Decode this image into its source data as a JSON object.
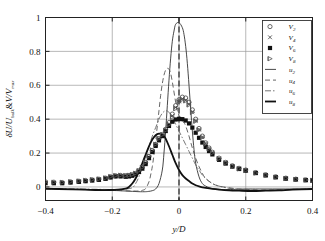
{
  "chart_data": {
    "type": "line",
    "title": "",
    "xlabel": "y/D",
    "ylabel": "δU/U_bulk & V/V_max",
    "ylabel_parts": {
      "delta": "δ",
      "U": "U",
      "bulk": "bulk",
      "amp": "&",
      "V": "V",
      "max": "max"
    },
    "xlim": [
      -0.4,
      0.4
    ],
    "ylim": [
      -0.08,
      1.0
    ],
    "xticks": [
      -0.4,
      -0.2,
      0,
      0.2,
      0.4
    ],
    "xticklabels": [
      "−0.4",
      "−0.2",
      "0",
      "0.2",
      "0.4"
    ],
    "yticks": [
      0,
      0.2,
      0.4,
      0.6,
      0.8,
      1
    ],
    "yticklabels": [
      "0",
      "0.2",
      "0.4",
      "0.6",
      "0.8",
      "1"
    ],
    "grid": "both",
    "vertical_marker_x": 0,
    "legend_position": "top-right",
    "legend": [
      {
        "name": "V2",
        "label": "V",
        "subscript": "2",
        "kind": "marker",
        "marker": "open-circle",
        "color": "#444444"
      },
      {
        "name": "V4",
        "label": "V",
        "subscript": "4",
        "kind": "marker",
        "marker": "cross",
        "color": "#444444"
      },
      {
        "name": "V6",
        "label": "V",
        "subscript": "6",
        "kind": "marker",
        "marker": "filled-square",
        "color": "#111111"
      },
      {
        "name": "V8",
        "label": "V",
        "subscript": "8",
        "kind": "marker",
        "marker": "right-triangle",
        "color": "#555555"
      },
      {
        "name": "u2",
        "label": "u",
        "subscript": "2",
        "kind": "line",
        "style": "solid-thin",
        "color": "#333333"
      },
      {
        "name": "u4",
        "label": "u",
        "subscript": "4",
        "kind": "line",
        "style": "dashed",
        "color": "#555555"
      },
      {
        "name": "u6",
        "label": "u",
        "subscript": "6",
        "kind": "line",
        "style": "dash-dot",
        "color": "#666666"
      },
      {
        "name": "u8",
        "label": "u",
        "subscript": "8",
        "kind": "line",
        "style": "solid-thick",
        "color": "#111111"
      }
    ],
    "series": [
      {
        "name": "u2",
        "style": "solid-thin",
        "x": [
          -0.4,
          -0.36,
          -0.32,
          -0.28,
          -0.24,
          -0.21,
          -0.18,
          -0.16,
          -0.14,
          -0.12,
          -0.1,
          -0.09,
          -0.08,
          -0.07,
          -0.06,
          -0.05,
          -0.045,
          -0.04,
          -0.035,
          -0.03,
          -0.025,
          -0.02,
          -0.015,
          -0.01,
          0.0,
          0.01,
          0.015,
          0.02,
          0.025,
          0.03,
          0.035,
          0.04,
          0.045,
          0.05,
          0.06,
          0.07,
          0.08,
          0.09,
          0.1,
          0.12,
          0.14,
          0.17,
          0.2,
          0.24,
          0.28,
          0.32,
          0.36,
          0.4
        ],
        "y": [
          -0.012,
          -0.015,
          -0.014,
          -0.016,
          -0.018,
          -0.02,
          -0.022,
          -0.024,
          -0.026,
          -0.028,
          -0.028,
          -0.026,
          -0.022,
          -0.012,
          0.02,
          0.1,
          0.2,
          0.33,
          0.48,
          0.63,
          0.76,
          0.86,
          0.92,
          0.96,
          0.97,
          0.94,
          0.9,
          0.83,
          0.73,
          0.6,
          0.46,
          0.33,
          0.22,
          0.14,
          0.06,
          0.02,
          0.005,
          -0.004,
          -0.01,
          -0.014,
          -0.016,
          -0.014,
          -0.012,
          -0.012,
          -0.012,
          -0.012,
          -0.012,
          -0.012
        ]
      },
      {
        "name": "u4",
        "style": "dashed",
        "x": [
          -0.4,
          -0.36,
          -0.32,
          -0.28,
          -0.24,
          -0.21,
          -0.18,
          -0.16,
          -0.14,
          -0.12,
          -0.11,
          -0.1,
          -0.09,
          -0.085,
          -0.08,
          -0.075,
          -0.07,
          -0.065,
          -0.06,
          -0.055,
          -0.05,
          -0.045,
          -0.04,
          -0.035,
          -0.03,
          -0.025,
          -0.02,
          -0.015,
          -0.01,
          -0.005,
          0.0,
          0.005,
          0.01,
          0.015,
          0.02,
          0.03,
          0.04,
          0.05,
          0.06,
          0.07,
          0.08,
          0.1,
          0.12,
          0.15,
          0.18,
          0.22,
          0.26,
          0.3,
          0.34,
          0.4
        ],
        "y": [
          -0.012,
          -0.014,
          -0.013,
          -0.015,
          -0.017,
          -0.019,
          -0.021,
          -0.023,
          -0.024,
          -0.024,
          -0.02,
          -0.01,
          0.03,
          0.07,
          0.12,
          0.19,
          0.27,
          0.36,
          0.45,
          0.54,
          0.61,
          0.66,
          0.69,
          0.7,
          0.695,
          0.67,
          0.62,
          0.56,
          0.5,
          0.45,
          0.42,
          0.4,
          0.39,
          0.38,
          0.36,
          0.3,
          0.23,
          0.17,
          0.12,
          0.08,
          0.05,
          0.02,
          0.005,
          -0.005,
          -0.012,
          -0.016,
          -0.018,
          -0.016,
          -0.014,
          -0.012
        ]
      },
      {
        "name": "u6",
        "style": "dash-dot",
        "x": [
          -0.4,
          -0.36,
          -0.32,
          -0.28,
          -0.24,
          -0.21,
          -0.18,
          -0.16,
          -0.14,
          -0.13,
          -0.12,
          -0.11,
          -0.1,
          -0.09,
          -0.08,
          -0.07,
          -0.06,
          -0.055,
          -0.05,
          -0.045,
          -0.04,
          -0.035,
          -0.03,
          -0.025,
          -0.02,
          -0.015,
          -0.01,
          0.0,
          0.01,
          0.02,
          0.03,
          0.04,
          0.05,
          0.06,
          0.07,
          0.08,
          0.1,
          0.12,
          0.15,
          0.18,
          0.22,
          0.26,
          0.3,
          0.34,
          0.4
        ],
        "y": [
          -0.01,
          -0.012,
          -0.012,
          -0.013,
          -0.014,
          -0.015,
          -0.014,
          -0.012,
          -0.005,
          0.02,
          0.06,
          0.12,
          0.18,
          0.24,
          0.3,
          0.35,
          0.4,
          0.42,
          0.435,
          0.445,
          0.45,
          0.448,
          0.44,
          0.43,
          0.41,
          0.39,
          0.37,
          0.33,
          0.29,
          0.25,
          0.21,
          0.17,
          0.13,
          0.1,
          0.07,
          0.05,
          0.02,
          0.005,
          -0.008,
          -0.014,
          -0.018,
          -0.02,
          -0.018,
          -0.015,
          -0.012
        ]
      },
      {
        "name": "u8",
        "style": "solid-thick",
        "x": [
          -0.4,
          -0.36,
          -0.32,
          -0.28,
          -0.24,
          -0.21,
          -0.18,
          -0.16,
          -0.15,
          -0.14,
          -0.13,
          -0.12,
          -0.11,
          -0.1,
          -0.09,
          -0.08,
          -0.07,
          -0.06,
          -0.05,
          -0.045,
          -0.04,
          -0.03,
          -0.02,
          -0.01,
          0.0,
          0.01,
          0.02,
          0.03,
          0.04,
          0.05,
          0.06,
          0.07,
          0.08,
          0.1,
          0.12,
          0.15,
          0.18,
          0.22,
          0.26,
          0.3,
          0.34,
          0.4
        ],
        "y": [
          -0.01,
          -0.012,
          -0.014,
          -0.016,
          -0.018,
          -0.018,
          -0.016,
          -0.01,
          0.0,
          0.02,
          0.05,
          0.09,
          0.14,
          0.19,
          0.24,
          0.28,
          0.305,
          0.315,
          0.31,
          0.3,
          0.285,
          0.24,
          0.19,
          0.14,
          0.1,
          0.07,
          0.05,
          0.035,
          0.02,
          0.01,
          0.003,
          -0.002,
          -0.006,
          -0.012,
          -0.016,
          -0.02,
          -0.022,
          -0.024,
          -0.022,
          -0.02,
          -0.016,
          -0.012
        ]
      },
      {
        "name": "V2",
        "style": "open-circle",
        "x": [
          -0.4,
          -0.375,
          -0.35,
          -0.325,
          -0.3,
          -0.28,
          -0.26,
          -0.24,
          -0.22,
          -0.205,
          -0.19,
          -0.175,
          -0.16,
          -0.15,
          -0.14,
          -0.13,
          -0.12,
          -0.11,
          -0.1,
          -0.09,
          -0.08,
          -0.07,
          -0.06,
          -0.05,
          -0.04,
          -0.03,
          -0.02,
          -0.01,
          0.0,
          0.01,
          0.02,
          0.03,
          0.04,
          0.05,
          0.06,
          0.07,
          0.08,
          0.09,
          0.1,
          0.12,
          0.14,
          0.16,
          0.18,
          0.2,
          0.23,
          0.26,
          0.29,
          0.32,
          0.35,
          0.38,
          0.4
        ],
        "y": [
          0.03,
          0.028,
          0.026,
          0.03,
          0.034,
          0.038,
          0.042,
          0.046,
          0.052,
          0.06,
          0.066,
          0.068,
          0.066,
          0.068,
          0.072,
          0.08,
          0.095,
          0.115,
          0.145,
          0.18,
          0.215,
          0.25,
          0.285,
          0.31,
          0.34,
          0.38,
          0.43,
          0.48,
          0.515,
          0.53,
          0.525,
          0.5,
          0.455,
          0.4,
          0.345,
          0.3,
          0.26,
          0.23,
          0.205,
          0.17,
          0.145,
          0.125,
          0.11,
          0.1,
          0.085,
          0.072,
          0.06,
          0.052,
          0.046,
          0.042,
          0.04
        ]
      },
      {
        "name": "V4",
        "style": "cross",
        "x": [
          -0.4,
          -0.375,
          -0.35,
          -0.325,
          -0.3,
          -0.28,
          -0.26,
          -0.24,
          -0.22,
          -0.205,
          -0.19,
          -0.175,
          -0.16,
          -0.15,
          -0.14,
          -0.13,
          -0.12,
          -0.11,
          -0.1,
          -0.09,
          -0.08,
          -0.07,
          -0.06,
          -0.05,
          -0.04,
          -0.03,
          -0.02,
          -0.01,
          0.0,
          0.01,
          0.02,
          0.03,
          0.04,
          0.05,
          0.06,
          0.07,
          0.08,
          0.09,
          0.1,
          0.12,
          0.14,
          0.16,
          0.18,
          0.2,
          0.23,
          0.26,
          0.29,
          0.32,
          0.35,
          0.38,
          0.4
        ],
        "y": [
          0.026,
          0.024,
          0.024,
          0.028,
          0.032,
          0.036,
          0.04,
          0.044,
          0.05,
          0.058,
          0.064,
          0.066,
          0.064,
          0.066,
          0.07,
          0.078,
          0.092,
          0.112,
          0.14,
          0.175,
          0.212,
          0.248,
          0.282,
          0.305,
          0.332,
          0.372,
          0.42,
          0.47,
          0.505,
          0.52,
          0.512,
          0.488,
          0.442,
          0.39,
          0.338,
          0.294,
          0.255,
          0.226,
          0.202,
          0.168,
          0.143,
          0.123,
          0.108,
          0.098,
          0.083,
          0.07,
          0.058,
          0.05,
          0.045,
          0.04,
          0.038
        ]
      },
      {
        "name": "V6",
        "style": "filled-square",
        "x": [
          -0.4,
          -0.375,
          -0.35,
          -0.325,
          -0.3,
          -0.28,
          -0.26,
          -0.24,
          -0.22,
          -0.205,
          -0.19,
          -0.175,
          -0.16,
          -0.15,
          -0.14,
          -0.13,
          -0.12,
          -0.11,
          -0.1,
          -0.09,
          -0.08,
          -0.07,
          -0.06,
          -0.05,
          -0.04,
          -0.03,
          -0.02,
          -0.01,
          0.0,
          0.01,
          0.02,
          0.03,
          0.04,
          0.05,
          0.06,
          0.07,
          0.08,
          0.09,
          0.1,
          0.12,
          0.14,
          0.16,
          0.18,
          0.2,
          0.23,
          0.26,
          0.29,
          0.32,
          0.35,
          0.38,
          0.4
        ],
        "y": [
          0.022,
          0.022,
          0.022,
          0.026,
          0.03,
          0.034,
          0.038,
          0.042,
          0.048,
          0.056,
          0.062,
          0.062,
          0.06,
          0.062,
          0.066,
          0.074,
          0.088,
          0.108,
          0.135,
          0.17,
          0.206,
          0.242,
          0.275,
          0.3,
          0.33,
          0.36,
          0.385,
          0.398,
          0.402,
          0.4,
          0.392,
          0.375,
          0.35,
          0.32,
          0.29,
          0.262,
          0.236,
          0.212,
          0.192,
          0.16,
          0.138,
          0.12,
          0.106,
          0.096,
          0.082,
          0.068,
          0.057,
          0.049,
          0.044,
          0.04,
          0.038
        ]
      },
      {
        "name": "V8",
        "style": "right-triangle",
        "x": [
          -0.4,
          -0.375,
          -0.35,
          -0.325,
          -0.3,
          -0.28,
          -0.26,
          -0.24,
          -0.22,
          -0.205,
          -0.19,
          -0.175,
          -0.16,
          -0.15,
          -0.14,
          -0.13,
          -0.12,
          -0.11,
          -0.1,
          -0.09,
          -0.08,
          -0.07,
          -0.06,
          -0.05,
          -0.04,
          -0.03,
          -0.02,
          -0.01,
          0.0,
          0.01,
          0.02,
          0.03,
          0.04,
          0.05,
          0.06,
          0.07,
          0.08,
          0.09,
          0.1,
          0.12,
          0.14,
          0.16,
          0.18,
          0.2,
          0.23,
          0.26,
          0.29,
          0.32,
          0.35,
          0.38,
          0.4
        ],
        "y": [
          0.03,
          0.028,
          0.027,
          0.031,
          0.035,
          0.039,
          0.043,
          0.047,
          0.053,
          0.061,
          0.067,
          0.069,
          0.067,
          0.069,
          0.073,
          0.081,
          0.096,
          0.116,
          0.146,
          0.182,
          0.218,
          0.252,
          0.286,
          0.308,
          0.334,
          0.368,
          0.412,
          0.462,
          0.5,
          0.515,
          0.508,
          0.484,
          0.44,
          0.388,
          0.336,
          0.292,
          0.254,
          0.225,
          0.201,
          0.167,
          0.142,
          0.122,
          0.107,
          0.097,
          0.082,
          0.07,
          0.058,
          0.05,
          0.045,
          0.041,
          0.039
        ]
      }
    ]
  }
}
